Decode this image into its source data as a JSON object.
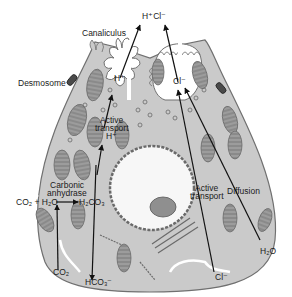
{
  "diagram": {
    "colors": {
      "cytoplasm": "#c9c9c9",
      "outline": "#6a6a6a",
      "mitochondria": "#9a9a9a",
      "nucleus": "#f6f6f6",
      "arrow": "#111111"
    },
    "labels": {
      "hcl_top": "H⁺Cl⁻",
      "canaliculus": "Canaliculus",
      "desmosome": "Desmosome",
      "h_plus_canal": "H⁺",
      "cl_minus_canal": "Cl⁻",
      "active_transport_h_line1": "Active",
      "active_transport_h_line2": "transport",
      "h_plus_inner": "H⁺",
      "carbonic_line1": "Carbonic",
      "carbonic_line2": "anhydrase",
      "reaction_left": "CO₂ + H₂O",
      "reaction_right": "H₂CO₃",
      "co2_bottom": "CO₂",
      "hco3_bottom": "HCO₃⁻",
      "active_transport_cl_line1": "Active",
      "active_transport_cl_line2": "transport",
      "diffusion": "Diffusion",
      "h2o_bottom": "H₂O",
      "cl_bottom": "Cl⁻"
    }
  }
}
